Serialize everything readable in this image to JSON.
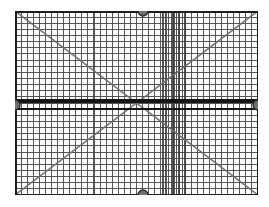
{
  "scene": {
    "title": "Wire Grid Panel",
    "background_color": "#ffffff",
    "description": "Rectangular wire mesh grid panel with diagonal cross braces and four edge-centre mounting knobs"
  },
  "panel": {
    "name": "grid-panel",
    "x": 15,
    "y": 11,
    "width": 243,
    "height": 184,
    "frame_color": "#1e1e1e",
    "frame_thickness": 3,
    "mesh_color": "#4a4a4a",
    "mesh_line_thickness": 1.1,
    "cell_size": 6.1,
    "columns": 40,
    "rows": 30
  },
  "midbar": {
    "name": "centre-rail",
    "color": "#141414",
    "thickness": 3.2,
    "y_offset": 90,
    "secondary_offset": 98,
    "secondary_thickness": 2.4
  },
  "diagonals": [
    {
      "name": "diagonal-brace-tl-br",
      "color": "#6e6e6e",
      "thickness": 1.6,
      "from": [
        0,
        0
      ],
      "to": [
        243,
        184
      ]
    },
    {
      "name": "diagonal-brace-bl-tr",
      "color": "#6e6e6e",
      "thickness": 1.6,
      "from": [
        0,
        184
      ],
      "to": [
        243,
        0
      ]
    }
  ],
  "knobs": [
    {
      "name": "mount-knob-top",
      "cx": 128,
      "cy": 0,
      "r": 5.0,
      "fill": "#707070",
      "stroke": "#2a2a2a"
    },
    {
      "name": "mount-knob-bottom",
      "cx": 128,
      "cy": 184,
      "r": 5.0,
      "fill": "#707070",
      "stroke": "#2a2a2a"
    },
    {
      "name": "mount-knob-left",
      "cx": 0,
      "cy": 94,
      "r": 5.0,
      "fill": "#707070",
      "stroke": "#2a2a2a"
    },
    {
      "name": "mount-knob-right",
      "cx": 243,
      "cy": 94,
      "r": 5.0,
      "fill": "#707070",
      "stroke": "#2a2a2a"
    }
  ],
  "dense_band": {
    "name": "dense-vertical-band",
    "color": "#3a3a3a",
    "x_start": 148,
    "x_end": 170,
    "line_count": 9
  },
  "labels": {
    "panel_label": "Grid panel",
    "knob_label": "Mounting knob",
    "diagonal_label": "Diagonal brace"
  }
}
